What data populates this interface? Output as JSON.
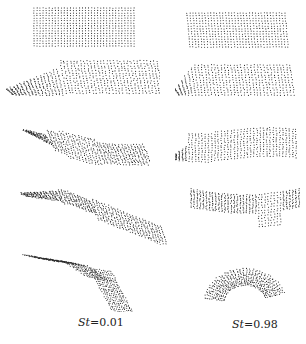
{
  "figure": {
    "columns": [
      {
        "label_var": "St",
        "label_eq": "=0.01",
        "label": "St=0.01"
      },
      {
        "label_var": "St",
        "label_eq": "=0.98",
        "label": "St=0.98"
      }
    ],
    "rows": 5,
    "dot_color": "#2a2a2a",
    "background": "#ffffff"
  }
}
